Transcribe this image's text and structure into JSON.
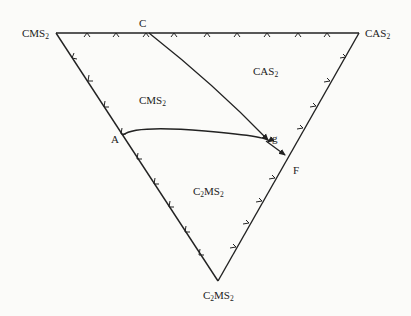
{
  "diagram": {
    "type": "ternary phase diagram (field of primary crystallization)",
    "vertices": {
      "top_left": {
        "label": "CMS",
        "sub": "2"
      },
      "top_right": {
        "label": "CAS",
        "sub": "2"
      },
      "bottom": {
        "label": "C",
        "sub1": "2",
        "mid": "MS",
        "sub2": "2"
      }
    },
    "fields": {
      "upper_left": {
        "label": "CMS",
        "sub": "2"
      },
      "upper_right": {
        "label": "CAS",
        "sub": "2"
      },
      "lower": {
        "label": "C",
        "sub1": "2",
        "mid": "MS",
        "sub2": "2"
      }
    },
    "points": {
      "C": "C",
      "A": "A",
      "g": "g",
      "F": "F"
    },
    "colors": {
      "line": "#222222",
      "background": "#fbfbf9"
    }
  }
}
